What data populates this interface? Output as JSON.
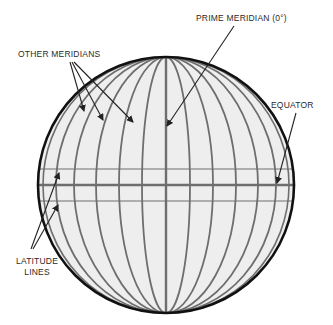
{
  "diagram": {
    "colors": {
      "background": "#ffffff",
      "globe_fill": "#eeeeee",
      "globe_outline": "#111111",
      "grid_lines": "#6e6e6e",
      "arrows": "#222222",
      "text": "#2a2a2a"
    },
    "labels": {
      "prime_meridian": "PRIME MERIDIAN (0°)",
      "other_meridians": "OTHER MERIDIANS",
      "equator": "EQUATOR",
      "latitude_line1": "LATITUDE",
      "latitude_line2": "LINES"
    },
    "globe": {
      "cx": 166,
      "cy": 185,
      "r": 128
    },
    "meridian_offsets": [
      0.19,
      0.37,
      0.55,
      0.72,
      0.86,
      0.96
    ],
    "latitudes_y": [
      169,
      185,
      201
    ]
  }
}
